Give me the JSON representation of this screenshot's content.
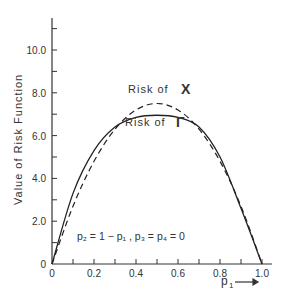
{
  "chart_data": {
    "type": "line",
    "title": "",
    "xlabel": "p1",
    "ylabel": "Value of Risk Function",
    "xlim": [
      0,
      1.0
    ],
    "ylim": [
      0,
      11.5
    ],
    "x_ticks": [
      "0",
      "0.2",
      "0.4",
      "0.6",
      "0.8",
      "1.0"
    ],
    "y_ticks": [
      "0",
      "2.0",
      "4.0",
      "6.0",
      "8.0",
      "10.0"
    ],
    "grid": false,
    "legend": "inline annotations",
    "annotation": "p2 = 1 - p1 , p3 = p4 = 0",
    "x": [
      0,
      0.1,
      0.2,
      0.3,
      0.4,
      0.5,
      0.6,
      0.7,
      0.8,
      0.9,
      1.0
    ],
    "series": [
      {
        "name": "Risk of X",
        "style": "dashed",
        "values": [
          0,
          2.7,
          4.8,
          6.3,
          7.2,
          7.5,
          7.2,
          6.3,
          4.8,
          2.7,
          0
        ]
      },
      {
        "name": "Risk of Γ",
        "style": "solid",
        "values": [
          0,
          3.3,
          5.3,
          6.4,
          6.85,
          6.95,
          6.85,
          6.4,
          5.0,
          2.6,
          0
        ]
      }
    ]
  },
  "labels": {
    "y_axis": "Value of Risk Function",
    "x_axis": "p",
    "x_axis_sub": "1",
    "risk_x": "Risk of",
    "risk_x_sym": "X",
    "risk_g": "Risk of",
    "risk_g_sym": "Γ",
    "note_a": "p",
    "note": "p₂ = 1 − p₁ , p₃ = p₄ = 0",
    "arrow": "⟶"
  }
}
